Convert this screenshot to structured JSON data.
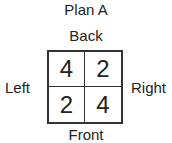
{
  "title": "Plan A",
  "labels": {
    "back": "Back",
    "front": "Front",
    "left": "Left",
    "right": "Right"
  },
  "grid": {
    "rows": [
      [
        "4",
        "2"
      ],
      [
        "2",
        "4"
      ]
    ]
  }
}
